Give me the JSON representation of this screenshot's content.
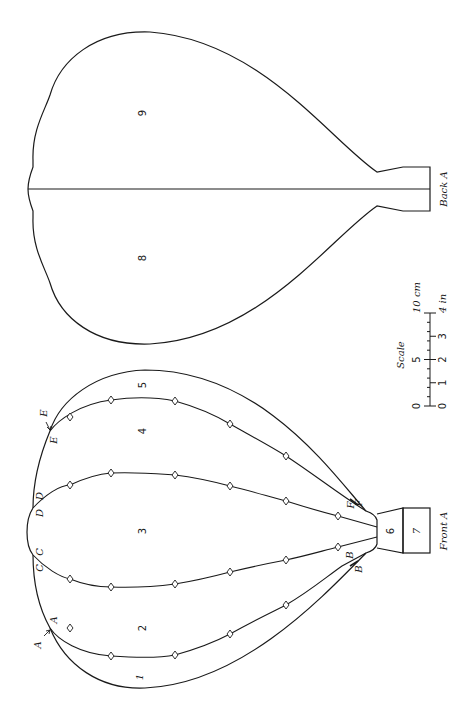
{
  "pieces": {
    "front": {
      "label": "Front A",
      "panels": [
        "1",
        "2",
        "3",
        "4",
        "5",
        "6",
        "7"
      ],
      "junction_labels": {
        "A_outer": "A",
        "A_inner": "A",
        "B_outer": "B",
        "B_inner": "B",
        "C_outer": "C",
        "C_inner": "C",
        "D_outer": "D",
        "D_inner": "D",
        "E_outer": "E",
        "E_inner": "E",
        "F_outer": "F",
        "F_inner": "F"
      }
    },
    "back": {
      "label": "Back A",
      "panels": [
        "8",
        "9"
      ]
    }
  },
  "scale": {
    "title": "Scale",
    "cm_labels": [
      "0",
      "5",
      "10 cm"
    ],
    "in_labels": [
      "0",
      "1",
      "2",
      "3",
      "4 in"
    ]
  },
  "colors": {
    "line": "#1a1a1a",
    "background": "#ffffff"
  }
}
